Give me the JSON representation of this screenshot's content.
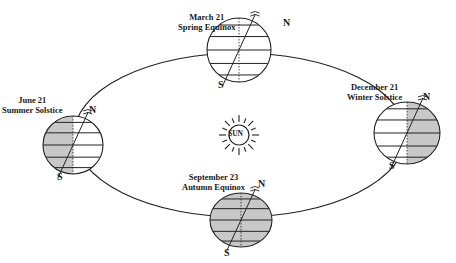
{
  "sun": {
    "label": "SUN",
    "cx": 239,
    "cy": 135,
    "r": 10
  },
  "orbit": {
    "cx": 240,
    "cy": 135,
    "rx": 166,
    "ry": 82
  },
  "colors": {
    "line": "#222222",
    "shade": "#c8c8c8",
    "background": "#ffffff"
  },
  "positions": [
    {
      "id": "spring",
      "date": "March 21",
      "event": "Spring Equinox",
      "cx": 239,
      "cy": 50,
      "rx": 32,
      "ry": 32,
      "shade": "none",
      "label_x": 178,
      "label_y": 12,
      "n_x": 283,
      "n_y": 17,
      "s_x": 218,
      "s_y": 79
    },
    {
      "id": "summer",
      "date": "June 21",
      "event": "Summer Solstice",
      "cx": 73,
      "cy": 145,
      "rx": 30,
      "ry": 29,
      "shade": "left",
      "label_x": 2,
      "label_y": 95,
      "n_x": 89,
      "n_y": 104,
      "s_x": 57,
      "s_y": 171
    },
    {
      "id": "winter",
      "date": "December 21",
      "event": "Winter Solstice",
      "cx": 407,
      "cy": 133,
      "rx": 33,
      "ry": 31,
      "shade": "right",
      "label_x": 347,
      "label_y": 82,
      "n_x": 423,
      "n_y": 91,
      "s_x": 389,
      "s_y": 160
    },
    {
      "id": "autumn",
      "date": "September 23",
      "event": "Autumn Equinox",
      "cx": 241,
      "cy": 220,
      "rx": 31,
      "ry": 27,
      "shade": "full",
      "label_x": 182,
      "label_y": 172,
      "n_x": 258,
      "n_y": 178,
      "s_x": 224,
      "s_y": 247
    }
  ],
  "pole_labels": {
    "north": "N",
    "south": "S"
  }
}
